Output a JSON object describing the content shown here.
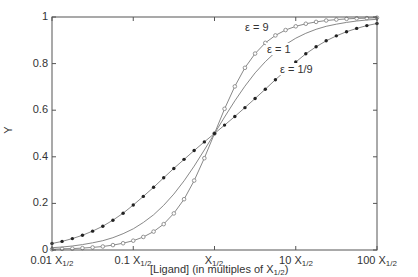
{
  "chart_data": {
    "type": "line",
    "title": "",
    "xlabel": "[Ligand] (in multiples of X1/2)",
    "ylabel": "Y",
    "xscale": "log",
    "xlim": [
      0.01,
      100
    ],
    "ylim": [
      0,
      1
    ],
    "x_tick_labels": [
      "0.01 X1/2",
      "0.1 X1/2",
      "X1/2",
      "10 X1/2",
      "100 X1/2"
    ],
    "y_tick_labels": [
      "0",
      "0.2",
      "0.4",
      "0.6",
      "0.8",
      "1"
    ],
    "grid": false,
    "legend": "inline annotations",
    "x": [
      0.01,
      0.0133,
      0.0178,
      0.0237,
      0.0316,
      0.0422,
      0.0562,
      0.075,
      0.1,
      0.133,
      0.178,
      0.237,
      0.316,
      0.422,
      0.562,
      0.75,
      1,
      1.33,
      1.78,
      2.37,
      3.16,
      4.22,
      5.62,
      7.5,
      10,
      13.3,
      17.8,
      23.7,
      31.6,
      42.2,
      56.2,
      75,
      100
    ],
    "series": [
      {
        "name": "ε = 9",
        "marker": "open-circle",
        "values": [
          0.003,
          0.005,
          0.006,
          0.008,
          0.011,
          0.015,
          0.021,
          0.029,
          0.04,
          0.056,
          0.079,
          0.111,
          0.157,
          0.218,
          0.298,
          0.394,
          0.5,
          0.606,
          0.702,
          0.782,
          0.843,
          0.889,
          0.921,
          0.944,
          0.96,
          0.971,
          0.979,
          0.985,
          0.989,
          0.992,
          0.994,
          0.995,
          0.997
        ]
      },
      {
        "name": "ε = 1",
        "marker": "none",
        "values": [
          0.01,
          0.013,
          0.017,
          0.023,
          0.031,
          0.04,
          0.053,
          0.07,
          0.091,
          0.118,
          0.151,
          0.192,
          0.24,
          0.297,
          0.36,
          0.429,
          0.5,
          0.571,
          0.64,
          0.703,
          0.76,
          0.808,
          0.849,
          0.882,
          0.909,
          0.93,
          0.947,
          0.96,
          0.969,
          0.977,
          0.983,
          0.987,
          0.99
        ]
      },
      {
        "name": "ε = 1/9",
        "marker": "filled-circle",
        "values": [
          0.028,
          0.037,
          0.049,
          0.063,
          0.081,
          0.102,
          0.128,
          0.158,
          0.193,
          0.23,
          0.269,
          0.31,
          0.35,
          0.389,
          0.427,
          0.464,
          0.5,
          0.536,
          0.573,
          0.611,
          0.65,
          0.69,
          0.731,
          0.77,
          0.807,
          0.842,
          0.872,
          0.898,
          0.919,
          0.937,
          0.951,
          0.963,
          0.972
        ]
      }
    ],
    "annotations": [
      {
        "text": "ε = 9",
        "x": 4.0,
        "y": 0.93
      },
      {
        "text": "ε = 1",
        "x": 7.0,
        "y": 0.83
      },
      {
        "text": "ε = 1/9",
        "x": 10.0,
        "y": 0.75
      }
    ]
  },
  "axis": {
    "ylabel": "Y",
    "xlabel_main": "[Ligand] (in multiples of X",
    "xlabel_sub": "1/2",
    "xlabel_end": ")",
    "yticks": [
      "0",
      "0.2",
      "0.4",
      "0.6",
      "0.8",
      "1"
    ],
    "xticks": [
      {
        "pre": "0.01 X",
        "sub": "1/2"
      },
      {
        "pre": "0.1 X",
        "sub": "1/2"
      },
      {
        "pre": "X",
        "sub": "1/2"
      },
      {
        "pre": "10 X",
        "sub": "1/2"
      },
      {
        "pre": "100 X",
        "sub": "1/2"
      }
    ]
  },
  "colors": {
    "axis": "#555555",
    "line": "#888888",
    "open_marker": "#888888",
    "filled_marker": "#222222"
  }
}
